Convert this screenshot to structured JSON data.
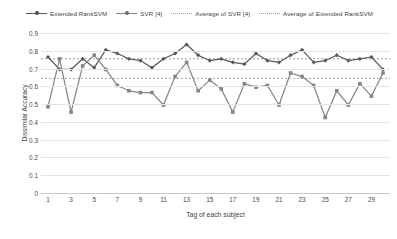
{
  "legend": {
    "items": [
      {
        "label": "Extended RankSVM",
        "style": "line-marker",
        "color": "#595959"
      },
      {
        "label": "SVR [4]",
        "style": "line-marker",
        "color": "#868686"
      },
      {
        "label": "Average of SVR [4]",
        "style": "dotted",
        "color": "#a6a6a6"
      },
      {
        "label": "Average of Extended RankSVM",
        "style": "dotted",
        "color": "#9c9c9c"
      }
    ]
  },
  "chart_data": {
    "type": "line",
    "title": "",
    "xlabel": "Tag of each subject",
    "ylabel": "Dissimilar Accuracy",
    "ylim": [
      0,
      0.9
    ],
    "yticks": [
      "0",
      "0.1",
      "0.2",
      "0.3",
      "0.4",
      "0.5",
      "0.6",
      "0.7",
      "0.8",
      "0.9"
    ],
    "ytick_values": [
      0,
      0.1,
      0.2,
      0.3,
      0.4,
      0.5,
      0.6,
      0.7,
      0.8,
      0.9
    ],
    "grid": true,
    "legend_position": "top",
    "x": [
      1,
      2,
      3,
      4,
      5,
      6,
      7,
      8,
      9,
      10,
      11,
      12,
      13,
      14,
      15,
      16,
      17,
      18,
      19,
      20,
      21,
      22,
      23,
      24,
      25,
      26,
      27,
      28,
      29,
      30
    ],
    "xtick_labels": [
      "1",
      "3",
      "5",
      "7",
      "9",
      "11",
      "13",
      "15",
      "17",
      "19",
      "21",
      "23",
      "25",
      "27",
      "29"
    ],
    "xtick_values": [
      1,
      3,
      5,
      7,
      9,
      11,
      13,
      15,
      17,
      19,
      21,
      23,
      25,
      27,
      29
    ],
    "series": [
      {
        "name": "Extended RankSVM",
        "color": "#595959",
        "marker": "diamond",
        "values": [
          0.765,
          0.695,
          0.695,
          0.755,
          0.705,
          0.805,
          0.785,
          0.755,
          0.745,
          0.705,
          0.755,
          0.785,
          0.835,
          0.775,
          0.745,
          0.755,
          0.735,
          0.725,
          0.785,
          0.745,
          0.735,
          0.775,
          0.805,
          0.735,
          0.745,
          0.775,
          0.745,
          0.755,
          0.765,
          0.695
        ]
      },
      {
        "name": "SVR [4]",
        "color": "#868686",
        "marker": "square",
        "values": [
          0.485,
          0.755,
          0.455,
          0.715,
          0.775,
          0.695,
          0.605,
          0.575,
          0.565,
          0.565,
          0.495,
          0.655,
          0.735,
          0.575,
          0.635,
          0.585,
          0.455,
          0.615,
          0.595,
          0.605,
          0.495,
          0.675,
          0.655,
          0.605,
          0.425,
          0.575,
          0.495,
          0.615,
          0.545,
          0.675
        ]
      }
    ],
    "average_lines": [
      {
        "name": "Average of Extended RankSVM",
        "value": 0.755,
        "color": "#9c9c9c",
        "style": "dotted"
      },
      {
        "name": "Average of SVR [4]",
        "value": 0.645,
        "color": "#a6a6a6",
        "style": "dotted"
      }
    ]
  }
}
